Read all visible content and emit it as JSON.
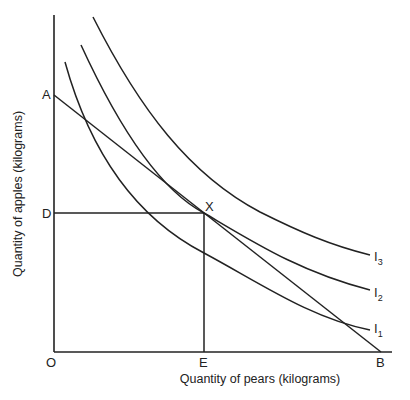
{
  "diagram": {
    "title": "",
    "axes": {
      "x_label": "Quantity of pears (kilograms)",
      "y_label": "Quantity of apples (kilograms)",
      "origin_label": "O"
    },
    "points": {
      "A": "A",
      "B": "B",
      "D": "D",
      "E": "E",
      "X": "X"
    },
    "curves": [
      {
        "name": "I",
        "sub": "1"
      },
      {
        "name": "I",
        "sub": "2"
      },
      {
        "name": "I",
        "sub": "3"
      }
    ],
    "colors": {
      "line": "#222222",
      "background": "#ffffff"
    }
  }
}
